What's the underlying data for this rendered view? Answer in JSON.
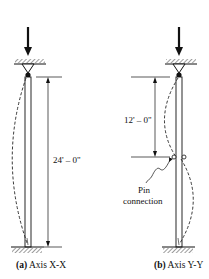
{
  "figure": {
    "panel_a": {
      "caption_tag": "(a)",
      "caption_text": "Axis X-X",
      "dimension_label": "24' – 0\"",
      "unbraced_length_ft": 24
    },
    "panel_b": {
      "caption_tag": "(b)",
      "caption_text": "Axis Y-Y",
      "dimension_label": "12' – 0\"",
      "unbraced_length_ft": 12,
      "annotation_line1": "Pin",
      "annotation_line2": "connection"
    }
  }
}
